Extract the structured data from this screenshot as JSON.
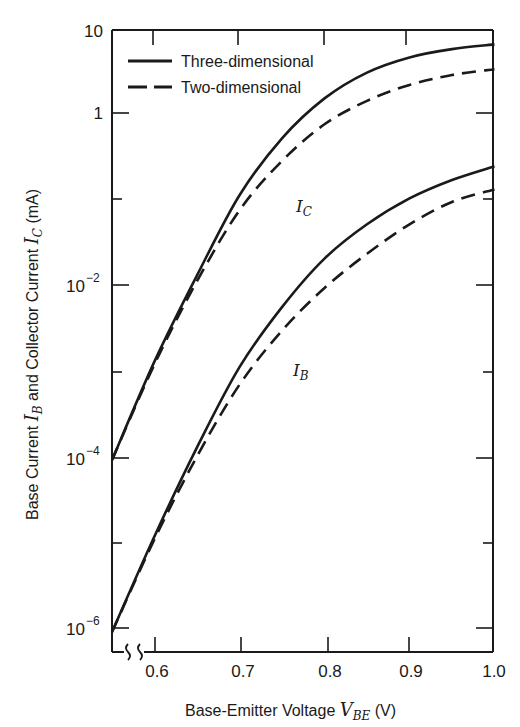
{
  "chart_data": {
    "type": "line",
    "title": "",
    "xlabel": "Base-Emitter Voltage V_BE (V)",
    "ylabel": "Base Current I_B and Collector Current I_C (mA)",
    "xlim": [
      0.55,
      1.0
    ],
    "ylim": [
      1e-06,
      10
    ],
    "yscale": "log",
    "x_break": true,
    "grid": false,
    "legend_position": "upper left",
    "x_ticks": [
      0.6,
      0.7,
      0.8,
      0.9,
      1.0
    ],
    "x_tick_labels": [
      "0.6",
      "0.7",
      "0.8",
      "0.9",
      "1.0"
    ],
    "y_ticks": [
      1e-06,
      1e-05,
      0.0001,
      0.001,
      0.01,
      0.1,
      1,
      10
    ],
    "y_tick_labels": [
      "10^-6",
      "",
      "10^-4",
      "",
      "10^-2",
      "",
      "1",
      "10"
    ],
    "x": [
      0.55,
      0.6,
      0.65,
      0.7,
      0.75,
      0.8,
      0.85,
      0.9,
      0.95,
      1.0
    ],
    "series": [
      {
        "name": "Three-dimensional",
        "curve": "I_C",
        "style": "solid",
        "values": [
          0.0001,
          0.0014,
          0.014,
          0.12,
          0.55,
          1.6,
          3.2,
          4.8,
          6.0,
          6.8
        ]
      },
      {
        "name": "Two-dimensional",
        "curve": "I_C",
        "style": "dashed",
        "values": [
          0.0001,
          0.0013,
          0.012,
          0.08,
          0.3,
          0.8,
          1.5,
          2.3,
          3.0,
          3.5
        ]
      },
      {
        "name": "Three-dimensional",
        "curve": "I_B",
        "style": "solid",
        "values": [
          1e-06,
          1.3e-05,
          0.00014,
          0.0012,
          0.006,
          0.022,
          0.055,
          0.11,
          0.18,
          0.26
        ]
      },
      {
        "name": "Two-dimensional",
        "curve": "I_B",
        "style": "dashed",
        "values": [
          1e-06,
          1.2e-05,
          0.00011,
          0.00075,
          0.0032,
          0.01,
          0.025,
          0.055,
          0.1,
          0.14
        ]
      }
    ],
    "legend": [
      "Three-dimensional",
      "Two-dimensional"
    ],
    "annotations": [
      {
        "text": "I_C",
        "x": 0.73,
        "y": 0.14
      },
      {
        "text": "I_B",
        "x": 0.74,
        "y": 0.0017
      }
    ]
  },
  "labels": {
    "legend_solid": "Three-dimensional",
    "legend_dashed": "Two-dimensional",
    "curve_ic_main": "I",
    "curve_ic_sub": "C",
    "curve_ib_main": "I",
    "curve_ib_sub": "B",
    "xlabel_prefix": "Base-Emitter Voltage ",
    "xlabel_var": "V",
    "xlabel_sub": "BE",
    "xlabel_unit": "  (V)",
    "ylabel_part1": "Base Current ",
    "ylabel_var1": "I",
    "ylabel_sub1": "B",
    "ylabel_part2": " and Collector Current ",
    "ylabel_var2": "I",
    "ylabel_sub2": "C",
    "ylabel_unit": " (mA)",
    "ytick_10": "10",
    "ytick_1": "1",
    "ytick_base": "10",
    "ytick_exp_m2": "−2",
    "ytick_exp_m4": "−4",
    "ytick_exp_m6": "−6",
    "xtick_06": "0.6",
    "xtick_07": "0.7",
    "xtick_08": "0.8",
    "xtick_09": "0.9",
    "xtick_10": "1.0"
  },
  "colors": {
    "line": "#1a1a1a",
    "background": "#ffffff"
  }
}
